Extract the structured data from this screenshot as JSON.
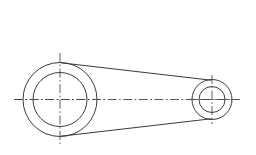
{
  "document": {
    "title": "Mechanical Part Outline Drawing",
    "view": "front-view",
    "background_color": "#ffffff",
    "line_color": "#3a3a3a",
    "centerline_color": "#4a4a4a"
  },
  "canvas": {
    "width": 256,
    "height": 155
  },
  "geometry": {
    "type": "2d-engineering-outline",
    "part": "connecting-rod",
    "large_boss": {
      "name": "large-boss",
      "center": {
        "x": 60,
        "y": 99.5
      },
      "outer_radius": 37,
      "inner_radius": 27,
      "crosshair": {
        "horizontal": {
          "x1": 14,
          "y1": 99.5,
          "x2": 106,
          "y2": 99.5
        },
        "vertical": {
          "x1": 60,
          "y1": 53,
          "x2": 60,
          "y2": 146
        }
      }
    },
    "small_boss": {
      "name": "small-boss",
      "center": {
        "x": 212,
        "y": 99.5
      },
      "outer_radius": 20,
      "inner_radius": 13,
      "crosshair": {
        "horizontal": {
          "x1": 188,
          "y1": 99.5,
          "x2": 236,
          "y2": 99.5
        },
        "vertical": {
          "x1": 212,
          "y1": 75,
          "x2": 212,
          "y2": 124
        }
      }
    },
    "shank": {
      "name": "shank-web",
      "upper_tangent": {
        "x1": 61,
        "y1": 62.8,
        "x2": 211,
        "y2": 80.2
      },
      "lower_tangent": {
        "x1": 61,
        "y1": 136.2,
        "x2": 211,
        "y2": 118.8
      }
    },
    "axis_centerline": {
      "name": "main-horizontal-axis",
      "x1": 14,
      "y1": 99.5,
      "x2": 240,
      "y2": 99.5
    }
  }
}
